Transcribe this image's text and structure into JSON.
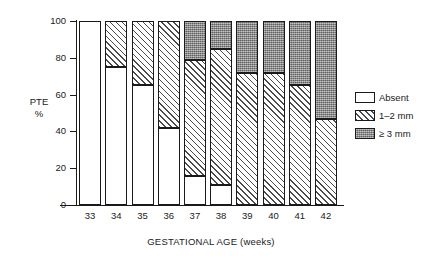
{
  "chart_data": {
    "type": "bar",
    "stacked": true,
    "title": "",
    "xlabel": "GESTATIONAL AGE (weeks)",
    "ylabel": "PTE\n%",
    "ylabel_line1": "PTE",
    "ylabel_line2": "%",
    "ylim": [
      0,
      100
    ],
    "yticks": [
      0,
      20,
      40,
      60,
      80,
      100
    ],
    "ytick_labels": [
      "0",
      "20",
      "40",
      "60",
      "80",
      "100"
    ],
    "grid": false,
    "legend_position": "right",
    "categories": [
      "33",
      "34",
      "35",
      "36",
      "37",
      "38",
      "39",
      "40",
      "41",
      "42"
    ],
    "series": [
      {
        "name": "Absent",
        "key": "absent",
        "values": [
          100,
          75,
          65,
          42,
          16,
          11,
          0,
          0,
          0,
          0
        ]
      },
      {
        "name": "1–2 mm",
        "key": "mid",
        "values": [
          0,
          25,
          35,
          58,
          63,
          74,
          72,
          72,
          65,
          47
        ]
      },
      {
        "name": "≥ 3 mm",
        "key": "dark",
        "values": [
          0,
          0,
          0,
          0,
          21,
          15,
          28,
          28,
          35,
          53
        ]
      }
    ]
  },
  "legend": {
    "items": [
      {
        "label": "Absent",
        "swatch": "open-white-swatch"
      },
      {
        "label": "1–2 mm",
        "swatch": "diagonal-hatch-swatch"
      },
      {
        "label": "≥ 3 mm",
        "swatch": "dark-stipple-swatch"
      }
    ]
  },
  "axes": {
    "y_title_line1": "PTE",
    "y_title_line2": "%",
    "x_title": "GESTATIONAL AGE (weeks)",
    "y_ticks": [
      "100",
      "80",
      "60",
      "40",
      "20",
      "0"
    ],
    "x_ticks": [
      "33",
      "34",
      "35",
      "36",
      "37",
      "38",
      "39",
      "40",
      "41",
      "42"
    ]
  }
}
